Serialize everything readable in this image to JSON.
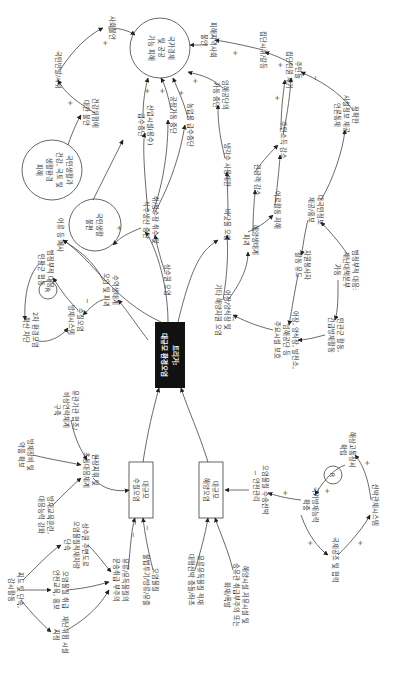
{
  "diagram": {
    "type": "causal-loop-diagram",
    "orientation": "rotated-90-clockwise",
    "trigger": {
      "line1": "트리거:",
      "line2": "대규모 환경오염"
    },
    "stocks": {
      "water": {
        "line1": "대규모",
        "line2": "수질오염"
      },
      "marine": {
        "line1": "대규모",
        "line2": "해양오염"
      }
    },
    "outcomes": {
      "economy": {
        "line1": "국가경제",
        "line2": "및 공공",
        "line3": "기능 피해"
      },
      "life_inconvenience": {
        "line1": "국민생활",
        "line2": "불편"
      },
      "life_health": {
        "line1": "국민생활과",
        "line2": "건강, 국토 및",
        "line3": "생활환경",
        "line4": "피해"
      }
    },
    "nodes": {
      "social_unrest": "사회불안",
      "public_complaints": "국민반발/시위",
      "health_anxiety_1": "건강위험에",
      "health_anxiety_2": "대한 불안",
      "damage_area_1": "피해지역사회",
      "damage_area_2": "불안",
      "group_conflict": "집단시위/갈등",
      "resident_group_1": "주민들",
      "resident_group_2": "집단민원 제기",
      "accurate_info_1": "정확한",
      "accurate_info_2": "사실정보 제공,",
      "accurate_info_3": "언론통제",
      "resident_income": "주민소득 감소",
      "tourism": "관광객 감소",
      "fishing_stop": "어로활동 저해",
      "marine_eco_1": "해양생태계",
      "marine_eco_2": "파괴",
      "fisheries_1": "어장/양식장 및",
      "fisheries_2": "기타 해양자원 오염",
      "seafood_1": "바닷물 오염",
      "seafood_2": "냉각수 사용제한",
      "plant_stop_1": "임해공단의",
      "plant_stop_2": "가동 중단",
      "public_info_1": "대국민정보",
      "public_info_2": "제공/홍보",
      "volunteers_1": "자원봉사자",
      "volunteers_2": "활동 유도",
      "gov_response_1": "범정부적 대응:",
      "gov_response_2": "재난대책본부",
      "gov_response_3": "가동",
      "civil_activity_1": "민관군 활동,",
      "civil_activity_2": "긴급방제활동",
      "protect_facilities_1": "어장, 양식장, 발전소,",
      "protect_facilities_2": "임해공단 등",
      "protect_facilities_3": "주요시설 보호",
      "water_supply_1": "취/정수장 취수 및",
      "water_supply_2": "식수생산 중단",
      "factory_stop": "공장가동 중단",
      "industrial_water_1": "산업시설(용수)",
      "industrial_water_2": "급수중단",
      "agri_water": "농업용 급수중단",
      "fish_kill": "어류 등 폐사",
      "upstream_pollution": "상수원 오염",
      "aquatic_eco_1": "수역생태계",
      "aquatic_eco_2": "오염 및 파괴",
      "gov_response_water_1": "범정부적 대응:",
      "gov_response_water_2": "민관군 협동",
      "water_warning_1": "수질오염",
      "water_warning_2": "방제시스템",
      "secondary_1": "2차 환경오염",
      "secondary_2": "확산 차단",
      "onsite_1": "현장지휘 및",
      "onsite_2": "초동대응체계",
      "agency_coop_1": "유관기관 협조/",
      "agency_coop_2": "비상연락체계",
      "agency_coop_3": "구축",
      "equipment_1": "방제장비 및",
      "equipment_2": "약품 확보",
      "training_1": "방재교육훈련,",
      "training_2": "대응능력 강화",
      "guidance_1": "지도 및 단속,",
      "guidance_2": "감시활동",
      "upstream_zone_1": "상수원 주변도로",
      "upstream_zone_2": "오염물질적재차량",
      "upstream_zone_3": "단속",
      "hazmat_transport_1": "오염물질 취급",
      "hazmat_transport_2": "안전교육, 홍보",
      "disaster_facility_1": "재난위험 시설",
      "disaster_facility_2": "지정",
      "leak_1": "유류/유독물질의",
      "leak_2": "운송취급 부주의",
      "illegal_1": "오염물질",
      "illegal_2": "불법투기/방류/유출",
      "oil_spill_1": "유류유독물질 적재",
      "oil_spill_2": "대형선박 충돌/좌초",
      "marine_facility_1": "해양시설 저유시설 및",
      "marine_facility_2": "송유관 취급부주의 또는",
      "marine_facility_3": "화재/폭발",
      "transport_safety_1": "오염물질 수송선박",
      "transport_safety_2": "안전관리",
      "national_capacity_1": "국가방제능력",
      "national_capacity_2": "확충",
      "marine_equipment_1": "해상고통장서",
      "marine_equipment_2": "확립",
      "vessel_system": "선박관제시스템",
      "intl_coop": "국제공조 및 협력"
    },
    "loops": [
      {
        "label": "R",
        "type": "reinforcing"
      },
      {
        "label": "R",
        "type": "reinforcing"
      }
    ],
    "signs": {
      "plus": "+",
      "minus": "−"
    }
  }
}
